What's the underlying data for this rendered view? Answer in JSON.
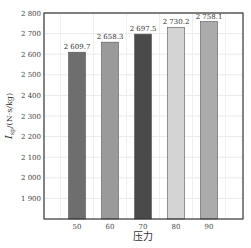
{
  "chart_data": {
    "type": "bar",
    "title": "",
    "xlabel": "压力",
    "ylabel": "I_sp/(N·s/kg)",
    "ylabel_main": "I",
    "ylabel_sub": "sp",
    "ylabel_unit": "/(N·s/kg)",
    "categories": [
      "50",
      "60",
      "70",
      "80",
      "90"
    ],
    "values": [
      2609.7,
      2658.3,
      2697.5,
      2730.2,
      2758.1
    ],
    "value_labels": [
      "2 609.7",
      "2 658.3",
      "2 697.5",
      "2 730.2",
      "2 758.1"
    ],
    "bar_colors": [
      "#6e6e6e",
      "#9a9a9a",
      "#4a4a4a",
      "#d4d4d4",
      "#ababab"
    ],
    "ylim": [
      1800,
      2800
    ],
    "yticks": [
      1900,
      2000,
      2100,
      2200,
      2300,
      2400,
      2500,
      2600,
      2700,
      2800
    ],
    "ytick_labels": [
      "1 900",
      "2 000",
      "2 100",
      "2 200",
      "2 300",
      "2 400",
      "2 500",
      "2 600",
      "2 700",
      "2 800"
    ],
    "grid": true,
    "legend": null
  }
}
